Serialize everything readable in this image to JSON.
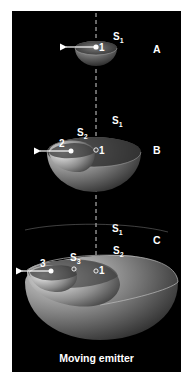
{
  "figure": {
    "caption": "Moving emitter",
    "panels": [
      {
        "id": "A",
        "label": "A",
        "spheres": [
          "S1"
        ],
        "emitter_position": "1"
      },
      {
        "id": "B",
        "label": "B",
        "spheres": [
          "S1",
          "S2"
        ],
        "positions": [
          "1",
          "2"
        ],
        "emitter_position": "2"
      },
      {
        "id": "C",
        "label": "C",
        "spheres": [
          "S1",
          "S2",
          "S3"
        ],
        "positions": [
          "1",
          "2",
          "3"
        ],
        "emitter_position": "3"
      }
    ],
    "labels": {
      "A": {
        "panel": "A",
        "s1": "S",
        "s1_sub": "1",
        "point1": "1"
      },
      "B": {
        "panel": "B",
        "s1": "S",
        "s1_sub": "1",
        "s2": "S",
        "s2_sub": "2",
        "point1": "1",
        "point2": "2"
      },
      "C": {
        "panel": "C",
        "s1": "S",
        "s1_sub": "1",
        "s2": "S",
        "s2_sub": "2",
        "s3": "S",
        "s3_sub": "3",
        "point1": "1",
        "point3": "3"
      }
    },
    "colors": {
      "background": "#000000",
      "page": "#ffffff",
      "foreground": "#ffffff"
    }
  }
}
